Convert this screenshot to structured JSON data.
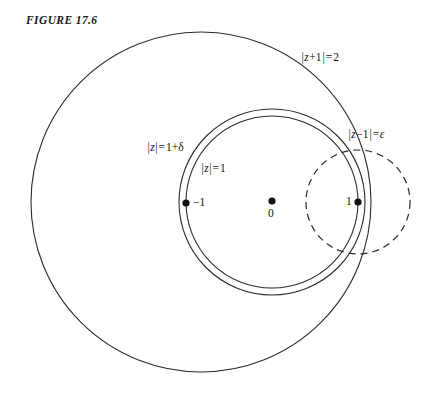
{
  "figure": {
    "title": "FIGURE 17.6",
    "stroke_color": "#2b2b2b",
    "label_color": "#111111",
    "background": "#ffffff"
  },
  "curves": {
    "outer_circle": {
      "name": "z-plus-1-modulus-2",
      "label_parts": {
        "bar_open": "|",
        "var": "z",
        "plus": "+1",
        "bar_close": "|",
        "equals": "=",
        "value": "2"
      },
      "label_text": "|z+1|=2",
      "center": {
        "x": 201,
        "y": 202
      },
      "radius": 170,
      "style": "solid"
    },
    "delta_circle": {
      "name": "z-modulus-1-plus-delta",
      "label_parts": {
        "bar_open": "|",
        "var": "z",
        "bar_close": "|",
        "equals": "=",
        "value": "1+δ"
      },
      "label_text": "|z|=1+δ",
      "center": {
        "x": 272,
        "y": 202
      },
      "radius": 93,
      "style": "solid"
    },
    "unit_circle": {
      "name": "z-modulus-1",
      "label_parts": {
        "bar_open": "|",
        "var": "z",
        "bar_close": "|",
        "equals": "=",
        "value": "1"
      },
      "label_text": "|z|=1",
      "center": {
        "x": 272,
        "y": 202
      },
      "radius": 86,
      "style": "solid"
    },
    "epsilon_circle": {
      "name": "z-minus-1-modulus-epsilon",
      "label_parts": {
        "bar_open": "|",
        "var": "z",
        "minus": "−1",
        "bar_close": "|",
        "equals": "=",
        "value": "ε"
      },
      "label_text": "|z−1|=ε",
      "center": {
        "x": 358,
        "y": 202
      },
      "radius": 52,
      "style": "dashed"
    }
  },
  "points": [
    {
      "name": "point-minus-one",
      "label": "−1",
      "x": 186,
      "y": 203
    },
    {
      "name": "point-zero",
      "label": "0",
      "x": 272,
      "y": 201
    },
    {
      "name": "point-one",
      "label": "1",
      "x": 358,
      "y": 202
    }
  ],
  "label_positions": {
    "outer_circle": {
      "x": 301,
      "y": 58
    },
    "delta_circle": {
      "x": 147,
      "y": 141
    },
    "unit_circle": {
      "x": 201,
      "y": 162
    },
    "epsilon_circle": {
      "x": 348,
      "y": 128
    },
    "point_minus_one": {
      "x": 193,
      "y": 196
    },
    "point_zero": {
      "x": 268,
      "y": 207
    },
    "point_one": {
      "x": 346,
      "y": 196
    }
  }
}
